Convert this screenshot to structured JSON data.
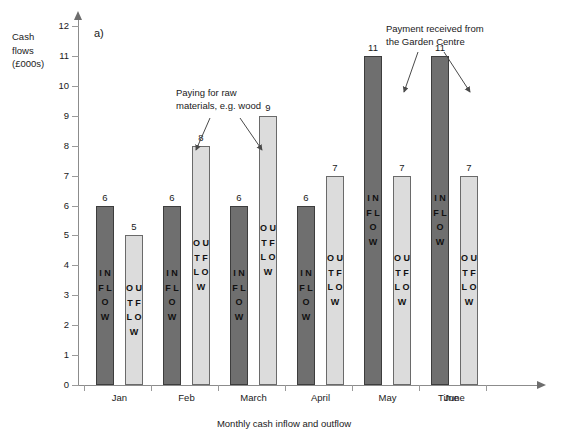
{
  "chart_data": {
    "type": "bar",
    "title": "",
    "panel_label": "a)",
    "xlabel": "Time",
    "ylabel": "Cash flows (£000s)",
    "caption": "Monthly cash inflow and outflow",
    "ylim": [
      0,
      12
    ],
    "ytick_labels": [
      "0",
      "1",
      "2",
      "3",
      "4",
      "5",
      "6",
      "7",
      "8",
      "9",
      "10",
      "11",
      "12"
    ],
    "grid": false,
    "legend": "none",
    "categories": [
      "Jan",
      "Feb",
      "March",
      "April",
      "May",
      "June"
    ],
    "series": [
      {
        "name": "INFLOW",
        "values": [
          6,
          6,
          6,
          6,
          11,
          11
        ]
      },
      {
        "name": "OUTFLOW",
        "values": [
          5,
          8,
          9,
          7,
          7,
          7
        ]
      }
    ],
    "annotations": [
      {
        "id": "raw-materials",
        "text": "Paying for raw\nmaterials, e.g. wood",
        "targets": [
          "Feb OUTFLOW",
          "March OUTFLOW"
        ]
      },
      {
        "id": "payment-received",
        "text": "Payment  received from\nthe Garden Centre",
        "targets": [
          "May INFLOW",
          "June INFLOW"
        ]
      }
    ]
  },
  "axis": {
    "y_title_lines": [
      "Cash",
      "flows",
      "(£000s)"
    ],
    "y_title": "Cash\nflows\n(£000s)",
    "x_title": "Time"
  },
  "colors": {
    "inflow": "#6f6f6f",
    "outflow": "#dcdcdc",
    "axis": "#8c8c8c",
    "text": "#1a1a1a"
  },
  "bar_letters": {
    "inflow": "I\nN\nF\nL\nO\nW",
    "outflow": "O\nU\nT\nF\nL\nO\nW"
  }
}
